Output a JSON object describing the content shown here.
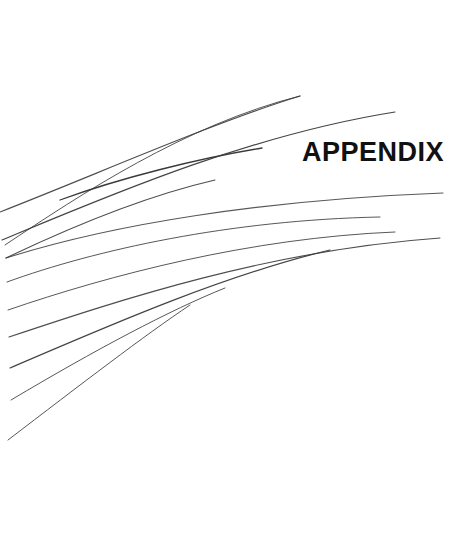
{
  "page": {
    "width": 475,
    "height": 538,
    "background_color": "#ffffff",
    "document_type": "section divider page"
  },
  "title": {
    "text": "APPENDIX",
    "color": "#111111",
    "font_size_px": 27,
    "font_weight": "bold",
    "x": 302,
    "y": 139
  },
  "decoration": {
    "name": "swoosh-arc-fan",
    "description": "Fan of thin curved arcs sweeping from lower-left upward to the right",
    "stroke_color": "#3a3a3a",
    "arc_count": 12,
    "arcs": [
      {
        "id": "arc-1",
        "d": "M 5 245 C 80 195, 185 125, 300 96",
        "stroke_width": 1.0,
        "opacity": 0.85
      },
      {
        "id": "arc-2",
        "d": "M 0 212 C 95 175, 215 122, 300 96",
        "stroke_width": 1.1,
        "opacity": 0.9
      },
      {
        "id": "arc-3",
        "d": "M 2 240 C 110 195, 250 135, 395 112",
        "stroke_width": 1.2,
        "opacity": 0.95
      },
      {
        "id": "arc-4",
        "d": "M 60 200 C 120 178, 200 158, 262 148",
        "stroke_width": 1.3,
        "opacity": 1.0
      },
      {
        "id": "arc-5",
        "d": "M 6 258 C 75 225, 150 195, 215 180",
        "stroke_width": 1.1,
        "opacity": 0.9
      },
      {
        "id": "arc-6",
        "d": "M 6 258 C 110 225, 260 200, 443 193",
        "stroke_width": 1.1,
        "opacity": 0.85
      },
      {
        "id": "arc-7",
        "d": "M 7 282 C 95 250, 230 220, 380 217",
        "stroke_width": 1.0,
        "opacity": 0.85
      },
      {
        "id": "arc-8",
        "d": "M 8 310 C 110 275, 250 238, 395 232",
        "stroke_width": 1.0,
        "opacity": 0.85
      },
      {
        "id": "arc-9",
        "d": "M 9 337 C 120 300, 270 250, 440 238",
        "stroke_width": 1.1,
        "opacity": 0.9
      },
      {
        "id": "arc-10",
        "d": "M 10 368 C 110 325, 225 275, 330 250",
        "stroke_width": 1.2,
        "opacity": 0.95
      },
      {
        "id": "arc-11",
        "d": "M 11 400 C 95 350, 170 310, 225 288",
        "stroke_width": 1.0,
        "opacity": 0.85
      },
      {
        "id": "arc-12",
        "d": "M 8 440 C 80 385, 145 335, 190 305",
        "stroke_width": 1.0,
        "opacity": 0.85
      }
    ]
  }
}
